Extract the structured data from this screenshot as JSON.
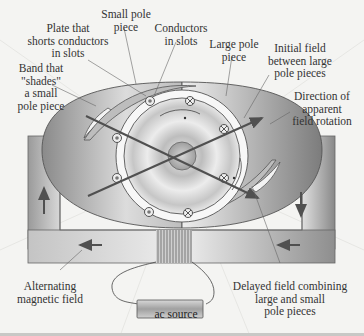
{
  "diagram": {
    "labels": {
      "plate": "Plate that\nshorts conductors\nin slots",
      "small_pole": "Small pole\npiece",
      "conductors": "Conductors\nin slots",
      "large_pole": "Large pole\npiece",
      "initial_field": "Initial field\nbetween large\npole pieces",
      "band": "Band that\n\"shades\"\na small\npole piece",
      "direction": "Direction of\napparent\nfield rotation",
      "alternating": "Alternating\nmagnetic field",
      "delayed": "Delayed field combining\nlarge and small\npole pieces",
      "source": "ac source"
    },
    "conductor_marks": [
      "dot",
      "cross",
      "dot",
      "cross",
      "dot",
      "cross",
      "dot",
      "cross"
    ],
    "colors": {
      "background": "#f4f4f2",
      "frame": "#a8a8a8",
      "arrow": "#505050",
      "line": "#555555"
    }
  }
}
